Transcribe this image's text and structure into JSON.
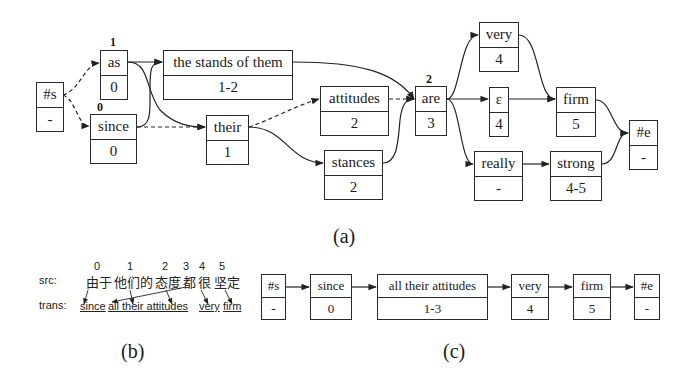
{
  "panel_a": {
    "caption": "(a)",
    "nodes": [
      {
        "id": "s",
        "word": "#s",
        "span": "-"
      },
      {
        "id": "as",
        "word": "as",
        "span": "0",
        "index": "1"
      },
      {
        "id": "since",
        "word": "since",
        "span": "0",
        "index": "0"
      },
      {
        "id": "stands",
        "word": "the stands of them",
        "span": "1-2"
      },
      {
        "id": "their",
        "word": "their",
        "span": "1"
      },
      {
        "id": "attitudes",
        "word": "attitudes",
        "span": "2"
      },
      {
        "id": "stances",
        "word": "stances",
        "span": "2"
      },
      {
        "id": "are",
        "word": "are",
        "span": "3",
        "index": "2"
      },
      {
        "id": "very",
        "word": "very",
        "span": "4"
      },
      {
        "id": "eps",
        "word": "ε",
        "span": "4"
      },
      {
        "id": "really",
        "word": "really",
        "span": "-"
      },
      {
        "id": "firm",
        "word": "firm",
        "span": "5"
      },
      {
        "id": "strong",
        "word": "strong",
        "span": "4-5"
      },
      {
        "id": "e",
        "word": "#e",
        "span": "-"
      }
    ],
    "edges": [
      {
        "from": "#s",
        "to": "as",
        "style": "dashed"
      },
      {
        "from": "#s",
        "to": "since",
        "style": "dashed"
      },
      {
        "from": "as",
        "to": "the stands of them",
        "style": "solid"
      },
      {
        "from": "as",
        "to": "their",
        "style": "solid"
      },
      {
        "from": "since",
        "to": "the stands of them",
        "style": "solid"
      },
      {
        "from": "since",
        "to": "their",
        "style": "dashed"
      },
      {
        "from": "the stands of them",
        "to": "are",
        "style": "solid"
      },
      {
        "from": "their",
        "to": "attitudes",
        "style": "dashed"
      },
      {
        "from": "their",
        "to": "stances",
        "style": "solid"
      },
      {
        "from": "attitudes",
        "to": "are",
        "style": "dashed"
      },
      {
        "from": "stances",
        "to": "are",
        "style": "solid"
      },
      {
        "from": "are",
        "to": "very",
        "style": "solid"
      },
      {
        "from": "are",
        "to": "ε",
        "style": "solid"
      },
      {
        "from": "are",
        "to": "really",
        "style": "solid"
      },
      {
        "from": "very",
        "to": "firm",
        "style": "solid"
      },
      {
        "from": "ε",
        "to": "firm",
        "style": "solid"
      },
      {
        "from": "really",
        "to": "strong",
        "style": "solid"
      },
      {
        "from": "firm",
        "to": "#e",
        "style": "solid"
      },
      {
        "from": "strong",
        "to": "#e",
        "style": "solid"
      }
    ]
  },
  "panel_b": {
    "caption": "(b)",
    "src_label": "src:",
    "trans_label": "trans:",
    "src_words": [
      {
        "index": "0",
        "text": "由于"
      },
      {
        "index": "1",
        "text": "他们的"
      },
      {
        "index": "2",
        "text": "态度"
      },
      {
        "index": "3",
        "text": "都"
      },
      {
        "index": "4",
        "text": "很"
      },
      {
        "index": "5",
        "text": "坚定"
      }
    ],
    "trans_words": [
      "since",
      "all their attitudes",
      "very",
      "firm"
    ]
  },
  "panel_c": {
    "caption": "(c)",
    "nodes": [
      {
        "word": "#s",
        "span": "-"
      },
      {
        "word": "since",
        "span": "0"
      },
      {
        "word": "all their attitudes",
        "span": "1-3"
      },
      {
        "word": "very",
        "span": "4"
      },
      {
        "word": "firm",
        "span": "5"
      },
      {
        "word": "#e",
        "span": "-"
      }
    ]
  }
}
